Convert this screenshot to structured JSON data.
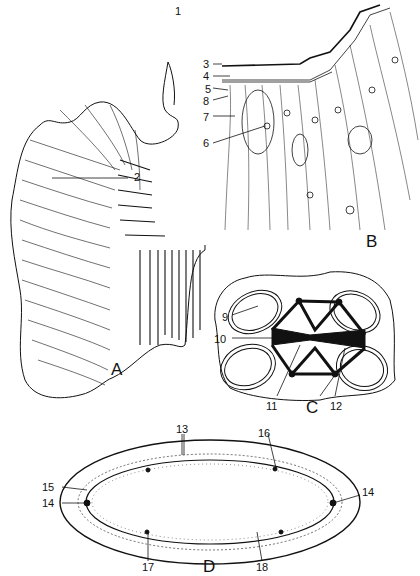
{
  "figure": {
    "panels": [
      {
        "id": "A",
        "label": "A",
        "markers": [
          {
            "num": "1"
          },
          {
            "num": "2"
          }
        ]
      },
      {
        "id": "B",
        "label": "B",
        "markers": [
          {
            "num": "3"
          },
          {
            "num": "4"
          },
          {
            "num": "5"
          },
          {
            "num": "8"
          },
          {
            "num": "7"
          },
          {
            "num": "6"
          }
        ]
      },
      {
        "id": "C",
        "label": "C",
        "markers": [
          {
            "num": "9"
          },
          {
            "num": "10"
          },
          {
            "num": "11"
          },
          {
            "num": "12"
          }
        ]
      },
      {
        "id": "D",
        "label": "D",
        "markers": [
          {
            "num": "13"
          },
          {
            "num": "16"
          },
          {
            "num": "15"
          },
          {
            "num": "14"
          },
          {
            "num": "14"
          },
          {
            "num": "17"
          },
          {
            "num": "18"
          }
        ]
      }
    ]
  },
  "colors": {
    "ink": "#111111",
    "background": "#ffffff"
  }
}
